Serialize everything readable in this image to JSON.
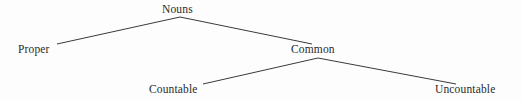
{
  "diagram": {
    "type": "tree",
    "background_color": "#fdfdfd",
    "line_color": "#3a3a3a",
    "text_color": "#2b2b2b",
    "nodes": [
      {
        "id": "nouns",
        "label": "Nouns",
        "level": 0,
        "x": 180,
        "y": 10
      },
      {
        "id": "proper",
        "label": "Proper",
        "level": 1,
        "x": 39,
        "y": 50
      },
      {
        "id": "common",
        "label": "Common",
        "level": 1,
        "x": 318,
        "y": 50
      },
      {
        "id": "countable",
        "label": "Countable",
        "level": 2,
        "x": 178,
        "y": 90
      },
      {
        "id": "uncountable",
        "label": "Uncountable",
        "level": 2,
        "x": 475,
        "y": 90
      }
    ],
    "edges": [
      {
        "from": "nouns",
        "to": "proper",
        "x1": 180,
        "y1": 17,
        "x2": 57,
        "y2": 44
      },
      {
        "from": "nouns",
        "to": "common",
        "x1": 180,
        "y1": 17,
        "x2": 312,
        "y2": 44
      },
      {
        "from": "common",
        "to": "countable",
        "x1": 318,
        "y1": 58,
        "x2": 203,
        "y2": 84
      },
      {
        "from": "common",
        "to": "uncountable",
        "x1": 318,
        "y1": 58,
        "x2": 456,
        "y2": 84
      }
    ]
  }
}
